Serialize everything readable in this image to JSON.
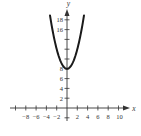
{
  "chart_data": {
    "type": "line",
    "title": "",
    "xlabel": "x",
    "ylabel": "y",
    "function": "y = x^2 + 8",
    "series": [
      {
        "name": "parabola",
        "x": [
          -3.3,
          -3,
          -2.5,
          -2,
          -1.5,
          -1,
          -0.5,
          0,
          0.5,
          1,
          1.5,
          2,
          2.5,
          3,
          3.3
        ],
        "y": [
          18.89,
          17,
          14.25,
          12,
          10.25,
          9,
          8.25,
          8,
          8.25,
          9,
          10.25,
          12,
          14.25,
          17,
          18.89
        ]
      }
    ],
    "vertex": [
      0,
      8
    ],
    "xlim": [
      -11,
      11.5
    ],
    "ylim": [
      -2.7,
      20
    ],
    "x_ticks": [
      -10,
      -8,
      -6,
      -4,
      -2,
      2,
      4,
      6,
      8,
      10
    ],
    "x_tick_labels": [
      "-8",
      "-6",
      "-4",
      "-2",
      "2",
      "4",
      "6",
      "8",
      "10"
    ],
    "y_ticks": [
      -2,
      2,
      4,
      6,
      8,
      10,
      12,
      14,
      16,
      18
    ],
    "y_tick_labels": [
      "2",
      "4",
      "6",
      "8",
      "16",
      "18"
    ],
    "grid": false,
    "legend": "none",
    "colors": {
      "curve": "#1a1a1a",
      "axis": "#333333"
    }
  },
  "labels": {
    "x_axis": "x",
    "y_axis": "y",
    "xt": [
      "−8",
      "−6",
      "−4",
      "−2",
      "2",
      "4",
      "6",
      "8",
      "10"
    ],
    "yt": [
      "2",
      "4",
      "6",
      "8",
      "16",
      "18"
    ]
  }
}
